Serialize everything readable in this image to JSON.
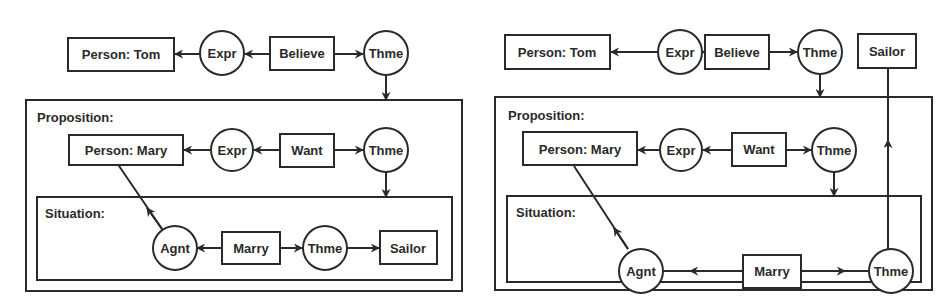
{
  "colors": {
    "stroke": "#2a2a2a",
    "background": "#ffffff",
    "text": "#2a2a2a"
  },
  "diagrams": [
    {
      "name": "left",
      "outer": {
        "concepts": {
          "tom": "Person: Tom",
          "believe": "Believe"
        },
        "relations": {
          "expr": "Expr",
          "thme": "Thme"
        }
      },
      "proposition": {
        "label": "Proposition:",
        "concepts": {
          "mary": "Person: Mary",
          "want": "Want"
        },
        "relations": {
          "expr": "Expr",
          "thme": "Thme"
        }
      },
      "situation": {
        "label": "Situation:",
        "concepts": {
          "marry": "Marry",
          "sailor": "Sailor"
        },
        "relations": {
          "agnt": "Agnt",
          "thme": "Thme"
        }
      }
    },
    {
      "name": "right",
      "outer": {
        "concepts": {
          "tom": "Person: Tom",
          "believe": "Believe",
          "sailor": "Sailor"
        },
        "relations": {
          "expr": "Expr",
          "thme": "Thme"
        }
      },
      "proposition": {
        "label": "Proposition:",
        "concepts": {
          "mary": "Person: Mary",
          "want": "Want"
        },
        "relations": {
          "expr": "Expr",
          "thme": "Thme"
        }
      },
      "situation": {
        "label": "Situation:",
        "concepts": {
          "marry": "Marry"
        },
        "relations": {
          "agnt": "Agnt",
          "thme": "Thme"
        }
      }
    }
  ]
}
